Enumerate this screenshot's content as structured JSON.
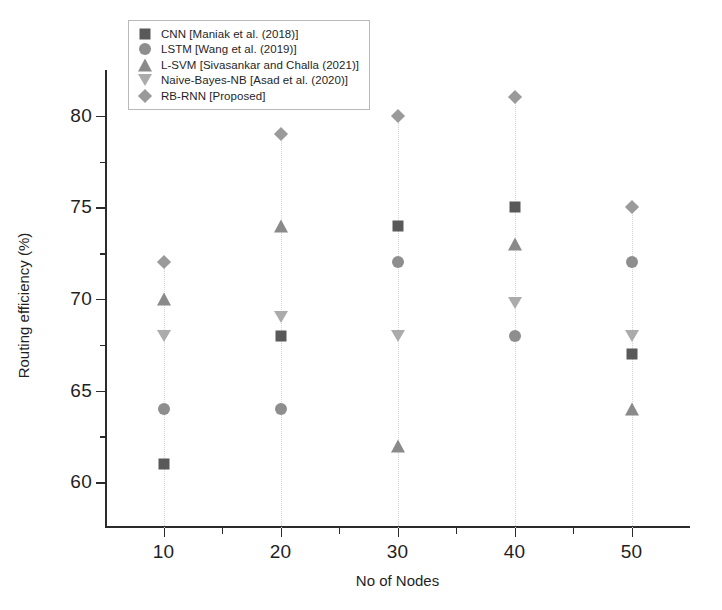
{
  "chart_data": {
    "type": "scatter",
    "title": "",
    "xlabel": "No of Nodes",
    "ylabel": "Routing efficiency (%)",
    "categories": [
      10,
      20,
      30,
      40,
      50
    ],
    "x": [
      10,
      20,
      30,
      40,
      50
    ],
    "xlim": [
      5,
      55
    ],
    "ylim": [
      57.5,
      82.5
    ],
    "xticks": [
      10,
      20,
      30,
      40,
      50
    ],
    "yticks": [
      60,
      65,
      70,
      75,
      80
    ],
    "xtick_labels": [
      "10",
      "20",
      "30",
      "40",
      "50"
    ],
    "ytick_labels": [
      "60",
      "65",
      "70",
      "75",
      "80"
    ],
    "minor_xticks": [
      15,
      25,
      35,
      45
    ],
    "minor_yticks": [
      62.5,
      67.5,
      72.5,
      77.5
    ],
    "grid": false,
    "legend_position": "upper-left",
    "series": [
      {
        "name": "CNN [Maniak et al. (2018)]",
        "marker": "square",
        "color": "#595959",
        "values": [
          61,
          68,
          74,
          75,
          67
        ]
      },
      {
        "name": "LSTM [Wang et al. (2019)]",
        "marker": "circle",
        "color": "#8e8e8e",
        "values": [
          64,
          64,
          72,
          68,
          72
        ]
      },
      {
        "name": "L-SVM [Sivasankar and Challa (2021)]",
        "marker": "triangle-up",
        "color": "#8a8a8a",
        "values": [
          70,
          74,
          62,
          73,
          64
        ]
      },
      {
        "name": "Naive-Bayes-NB [Asad et al. (2020)]",
        "marker": "triangle-down",
        "color": "#ababab",
        "values": [
          68,
          69,
          68,
          69.8,
          68
        ]
      },
      {
        "name": "RB-RNN [Proposed]",
        "marker": "diamond",
        "color": "#9a9a9a",
        "values": [
          72,
          79,
          80,
          81,
          75
        ]
      }
    ]
  },
  "legend": {
    "items": [
      {
        "label": "CNN [Maniak et al. (2018)]",
        "marker": "square"
      },
      {
        "label": "LSTM [Wang et al. (2019)]",
        "marker": "circle"
      },
      {
        "label": "L-SVM [Sivasankar and Challa (2021)]",
        "marker": "triangle-up"
      },
      {
        "label": "Naive-Bayes-NB [Asad et al. (2020)]",
        "marker": "triangle-down"
      },
      {
        "label": "RB-RNN [Proposed]",
        "marker": "diamond"
      }
    ]
  }
}
